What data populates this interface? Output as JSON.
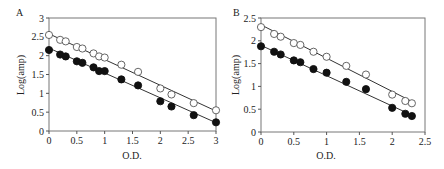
{
  "figure": {
    "panels": [
      {
        "label": "A",
        "xlabel": "O.D.",
        "ylabel": "Log(amp)",
        "frame": {
          "left": 49,
          "top": 18,
          "right": 216,
          "bottom": 131
        },
        "xlim": [
          0,
          3
        ],
        "ylim": [
          0,
          3
        ],
        "xticks": [
          0,
          0.5,
          1,
          1.5,
          2,
          2.5,
          3
        ],
        "xtick_labels": [
          "0",
          "0.5",
          "1",
          "1.5",
          "2",
          "2.5",
          "3"
        ],
        "yticks": [
          0,
          0.5,
          1,
          1.5,
          2,
          2.5,
          3
        ],
        "ytick_labels": [
          "0",
          "0.5",
          "1",
          "1.5",
          "2",
          "2.5",
          "3"
        ]
      },
      {
        "label": "B",
        "xlabel": "O.D.",
        "ylabel": "Log(amp)",
        "frame": {
          "left": 261,
          "top": 18,
          "right": 425,
          "bottom": 132
        },
        "xlim": [
          0,
          2.5
        ],
        "ylim": [
          0,
          2.5
        ],
        "xticks": [
          0,
          0.5,
          1,
          1.5,
          2,
          2.5
        ],
        "xtick_labels": [
          "0",
          "0.5",
          "1",
          "1.5",
          "2",
          "2.5"
        ],
        "yticks": [
          0,
          0.5,
          1,
          1.5,
          2,
          2.5
        ],
        "ytick_labels": [
          "0",
          "0.5",
          "1",
          "1.5",
          "2",
          "2.5"
        ]
      }
    ]
  },
  "chart_data": [
    {
      "type": "scatter",
      "title": "A",
      "xlabel": "O.D.",
      "ylabel": "Log(amp)",
      "xlim": [
        0,
        3
      ],
      "ylim": [
        0,
        3
      ],
      "grid": false,
      "legend": null,
      "series": [
        {
          "name": "open circles",
          "marker": "open-circle",
          "x": [
            0,
            0.2,
            0.3,
            0.5,
            0.6,
            0.8,
            0.9,
            1.0,
            1.3,
            1.6,
            2.0,
            2.2,
            2.6,
            3.0
          ],
          "y": [
            2.55,
            2.42,
            2.38,
            2.23,
            2.19,
            2.06,
            1.98,
            1.95,
            1.76,
            1.57,
            1.13,
            0.97,
            0.74,
            0.55
          ],
          "fit_line": {
            "x": [
              0,
              3
            ],
            "y": [
              2.58,
              0.53
            ]
          }
        },
        {
          "name": "filled circles",
          "marker": "filled-circle",
          "x": [
            0,
            0.2,
            0.3,
            0.5,
            0.6,
            0.8,
            0.9,
            1.0,
            1.3,
            1.6,
            2.0,
            2.2,
            2.6,
            3.0
          ],
          "y": [
            2.15,
            2.03,
            1.98,
            1.85,
            1.81,
            1.69,
            1.59,
            1.59,
            1.37,
            1.21,
            0.79,
            0.65,
            0.42,
            0.23
          ],
          "fit_line": {
            "x": [
              0,
              3
            ],
            "y": [
              2.2,
              0.22
            ]
          }
        }
      ]
    },
    {
      "type": "scatter",
      "title": "B",
      "xlabel": "O.D.",
      "ylabel": "Log(amp)",
      "xlim": [
        0,
        2.5
      ],
      "ylim": [
        0,
        2.5
      ],
      "grid": false,
      "legend": null,
      "series": [
        {
          "name": "open circles",
          "marker": "open-circle",
          "x": [
            0,
            0.2,
            0.3,
            0.5,
            0.6,
            0.8,
            1.0,
            1.3,
            1.6,
            2.0,
            2.2,
            2.3
          ],
          "y": [
            2.3,
            2.15,
            2.09,
            1.95,
            1.91,
            1.76,
            1.65,
            1.45,
            1.26,
            0.82,
            0.68,
            0.63
          ],
          "fit_line": {
            "x": [
              0,
              2.3
            ],
            "y": [
              2.35,
              0.67
            ]
          }
        },
        {
          "name": "filled circles",
          "marker": "filled-circle",
          "x": [
            0,
            0.2,
            0.3,
            0.5,
            0.6,
            0.8,
            1.0,
            1.3,
            1.6,
            2.0,
            2.2,
            2.3
          ],
          "y": [
            1.88,
            1.76,
            1.7,
            1.57,
            1.53,
            1.38,
            1.3,
            1.1,
            0.94,
            0.53,
            0.4,
            0.35
          ],
          "fit_line": {
            "x": [
              0,
              2.3
            ],
            "y": [
              1.9,
              0.37
            ]
          }
        }
      ]
    }
  ]
}
